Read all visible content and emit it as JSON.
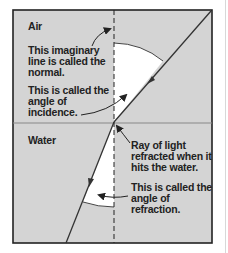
{
  "diagram": {
    "colors": {
      "background": "#d4d4d4",
      "angle_fill": "#ffffff",
      "line": "#333333",
      "frame": "#222222"
    },
    "regions": {
      "top": "Air",
      "bottom": "Water"
    },
    "labels": {
      "normal": "This imaginary\nline is called the\nnormal.",
      "incidence": "This is called the\nangle of\nincidence.",
      "refracted_ray": "Ray of light\nrefracted when it\nhits the water.",
      "refraction": "This is called the\nangle of\nrefraction."
    }
  }
}
